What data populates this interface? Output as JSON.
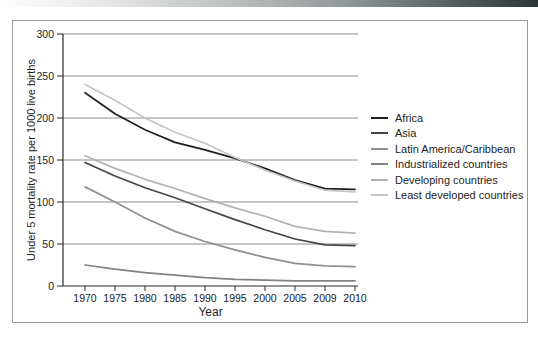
{
  "page": {
    "background": "#ffffff"
  },
  "header_bar": {
    "gradient_left": "#fefefe",
    "gradient_right": "#2e3536"
  },
  "chart_data": {
    "type": "line",
    "title": "",
    "xlabel": "Year",
    "ylabel": "Under 5 mortality rate per 1000 live births",
    "categories": [
      "1970",
      "1975",
      "1980",
      "1985",
      "1990",
      "1995",
      "2000",
      "2005",
      "2009",
      "2010"
    ],
    "yticks": [
      0,
      50,
      100,
      150,
      200,
      250,
      300
    ],
    "ylim": [
      0,
      300
    ],
    "grid": true,
    "legend_position": "right",
    "colors": {
      "grid": "#8c8c8c",
      "axis": "#2b2b2b",
      "tick_text": "#222222"
    },
    "series": [
      {
        "name": "Africa",
        "color": "#1f1f1f",
        "values": [
          230,
          205,
          186,
          171,
          162,
          152,
          140,
          126,
          116,
          115
        ]
      },
      {
        "name": "Asia",
        "color": "#454545",
        "values": [
          147,
          131,
          117,
          105,
          92,
          79,
          67,
          56,
          49,
          48
        ]
      },
      {
        "name": "Latin America/Caribbean",
        "color": "#909090",
        "values": [
          118,
          100,
          81,
          65,
          53,
          43,
          34,
          27,
          24,
          23
        ]
      },
      {
        "name": "Industrialized countries",
        "color": "#828282",
        "values": [
          25,
          20,
          16,
          13,
          10,
          8,
          7,
          6,
          6,
          6
        ]
      },
      {
        "name": "Developing countries",
        "color": "#b3b3b3",
        "values": [
          155,
          140,
          127,
          116,
          104,
          93,
          83,
          71,
          65,
          63
        ]
      },
      {
        "name": "Least developed countries",
        "color": "#c4c4c4",
        "values": [
          240,
          221,
          200,
          183,
          170,
          153,
          138,
          125,
          114,
          112
        ]
      }
    ]
  }
}
